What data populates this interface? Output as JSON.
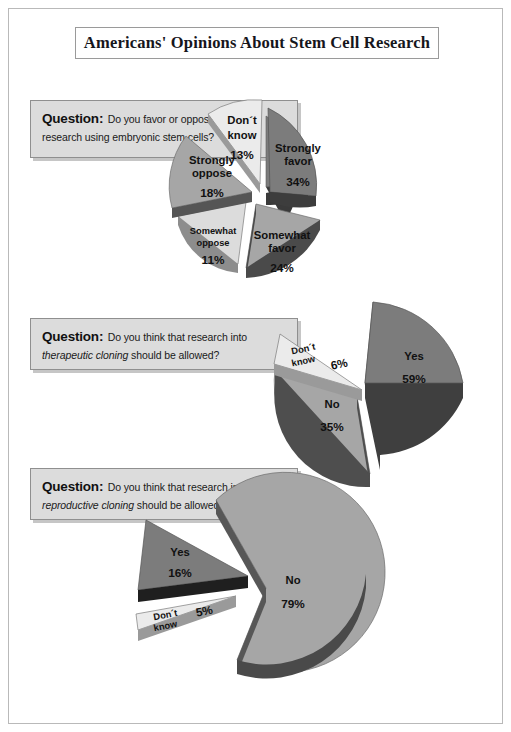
{
  "page": {
    "title": "Americans' Opinions About Stem Cell Research"
  },
  "questions": [
    {
      "label": "Question:",
      "text_parts": [
        {
          "text": "Do you favor or oppose medical research using embryonic stem cells?",
          "italic": false
        }
      ],
      "plain": "Do you favor or oppose medical research using embryonic stem cells?"
    },
    {
      "label": "Question:",
      "text_parts": [
        {
          "text": "Do you think that research into ",
          "italic": false
        },
        {
          "text": "therapeutic cloning",
          "italic": true
        },
        {
          "text": " should be allowed?",
          "italic": false
        }
      ],
      "plain": "Do you think that research into therapeutic cloning should be allowed?"
    },
    {
      "label": "Question:",
      "text_parts": [
        {
          "text": "Do you think that research into ",
          "italic": false
        },
        {
          "text": "reproductive cloning",
          "italic": true
        },
        {
          "text": " should be allowed?",
          "italic": false
        }
      ],
      "plain": "Do you think that research into reproductive cloning should be allowed?"
    }
  ],
  "colors": {
    "dark_gray": "#7c7c7c",
    "medium_gray": "#a6a6a6",
    "light_gray": "#dcdcdc",
    "very_light_gray": "#ebebeb",
    "edge_dark": "#3a3a3a",
    "box_fill": "#dcdcdc",
    "page_border": "#b9b9b9"
  },
  "chart_data": [
    {
      "type": "pie",
      "title": "Do you favor or oppose medical research using embryonic stem cells?",
      "exploded": true,
      "categories": [
        "Strongly favor",
        "Somewhat favor",
        "Somewhat oppose",
        "Strongly oppose",
        "Don't know"
      ],
      "values": [
        34,
        24,
        11,
        18,
        13
      ],
      "labels": [
        "34%",
        "24%",
        "11%",
        "18%",
        "13%"
      ],
      "slice_colors": [
        "#7c7c7c",
        "#a6a6a6",
        "#dcdcdc",
        "#a6a6a6",
        "#ebebeb"
      ],
      "units": "percent"
    },
    {
      "type": "pie",
      "title": "Do you think that research into therapeutic cloning should be allowed?",
      "exploded": true,
      "categories": [
        "Yes",
        "No",
        "Don't know"
      ],
      "values": [
        59,
        35,
        6
      ],
      "labels": [
        "59%",
        "35%",
        "6%"
      ],
      "slice_colors": [
        "#7c7c7c",
        "#a6a6a6",
        "#ebebeb"
      ],
      "units": "percent"
    },
    {
      "type": "pie",
      "title": "Do you think that research into reproductive cloning should be allowed?",
      "exploded": true,
      "categories": [
        "No",
        "Yes",
        "Don't know"
      ],
      "values": [
        79,
        16,
        5
      ],
      "labels": [
        "79%",
        "16%",
        "5%"
      ],
      "slice_colors": [
        "#a6a6a6",
        "#7c7c7c",
        "#ebebeb"
      ],
      "units": "percent"
    }
  ]
}
